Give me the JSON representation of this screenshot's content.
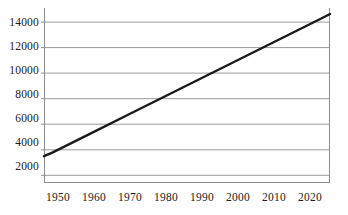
{
  "chart_data": {
    "type": "line",
    "title": "",
    "subtitle": "",
    "xlabel": "",
    "ylabel": "",
    "xlim": [
      1948,
      2022
    ],
    "ylim": [
      1400,
      15100
    ],
    "grid": true,
    "legend": false,
    "legend_position": "none",
    "x_ticks": [
      1950,
      1960,
      1970,
      1980,
      1990,
      2000,
      2010,
      2020
    ],
    "x_tick_labels": [
      "1950",
      "1960",
      "1970",
      "1980",
      "1990",
      "2000",
      "2010",
      "2020"
    ],
    "y_ticks": [
      2000,
      4000,
      6000,
      8000,
      10000,
      12000,
      14000
    ],
    "y_tick_labels": [
      "2000",
      "4000",
      "6000",
      "8000",
      "10000",
      "12000",
      "14000"
    ],
    "series": [
      {
        "name": "series-1",
        "color": "#1a1a1a",
        "line_width": 2.4,
        "x": [
          1948,
          1950,
          1960,
          1970,
          1980,
          1990,
          2000,
          2010,
          2020,
          2022
        ],
        "values": [
          3500,
          3760,
          5270,
          6780,
          8290,
          9800,
          11300,
          12810,
          14320,
          14630
        ]
      }
    ],
    "colors": {
      "line": "#1a1a1a",
      "grid": "#9a9a9a",
      "axis": "#8c8c8c",
      "text": "#202020",
      "background": "#ffffff"
    },
    "annotations": []
  }
}
